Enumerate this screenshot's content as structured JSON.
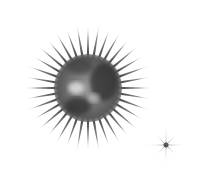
{
  "image": {
    "background": "#ffffff",
    "spiky_ball": {
      "name": "spiky-ball",
      "center": [
        88,
        88
      ],
      "body_radius": 33,
      "spike_outer_radius": 68,
      "spike_count": 36,
      "colors": {
        "dark": "#2a2a2a",
        "mid": "#7a7a7a",
        "light": "#d8d8d8"
      }
    },
    "sparkle": {
      "name": "sparkle",
      "center": [
        166,
        145
      ],
      "long_ray": 26,
      "short_ray": 14,
      "color": "#555555"
    }
  }
}
